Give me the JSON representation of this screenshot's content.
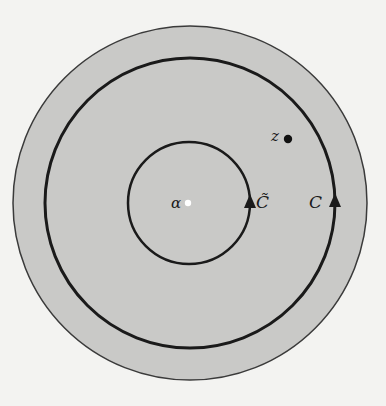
{
  "figure": {
    "colors": {
      "background": "#f3f3f1",
      "disk_fill": "#c9c9c7",
      "stroke": "#1a1a1a",
      "center_point": "#ffffff"
    },
    "outer_disk": {
      "cx": 190,
      "cy": 203,
      "r": 177
    },
    "contour_outer": {
      "cx": 190,
      "cy": 203,
      "r": 145,
      "arrow_direction": "counterclockwise (up on right side)"
    },
    "contour_inner": {
      "cx": 189,
      "cy": 203,
      "r": 61,
      "arrow_direction": "counterclockwise (up on right side)"
    },
    "points": {
      "alpha": {
        "cx": 188,
        "cy": 203,
        "r": 3
      },
      "z": {
        "cx": 288,
        "cy": 139,
        "r": 4
      }
    }
  },
  "labels": {
    "z": "z",
    "alpha": "α",
    "c_tilde": "C̃",
    "c": "C"
  }
}
